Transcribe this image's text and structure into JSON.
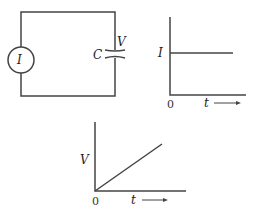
{
  "circuit": {
    "source_label": "I",
    "capacitor_label": "C",
    "voltage_label": "V"
  },
  "graph_current": {
    "y_label": "I",
    "origin_label": "0",
    "x_label": "t"
  },
  "graph_voltage": {
    "y_label": "V",
    "origin_label": "0",
    "x_label": "t"
  },
  "colors": {
    "line": "#444444",
    "text": "#222222"
  }
}
